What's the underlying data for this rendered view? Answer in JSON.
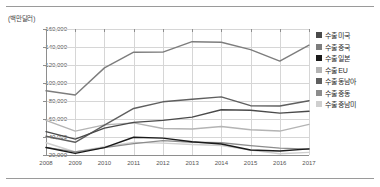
{
  "chart_data": {
    "type": "line",
    "title": "",
    "xlabel": "",
    "ylabel": "(백만달러)",
    "unit_label": "(백만달러)",
    "grid": true,
    "legend_position": "right",
    "x": [
      2008,
      2009,
      2010,
      2011,
      2012,
      2013,
      2014,
      2015,
      2016,
      2017
    ],
    "categories": [
      "2008",
      "2009",
      "2010",
      "2011",
      "2012",
      "2013",
      "2014",
      "2015",
      "2016",
      "2017"
    ],
    "ylim": [
      20000,
      160000
    ],
    "yticks": [
      20000,
      40000,
      60000,
      80000,
      100000,
      120000,
      140000,
      160000
    ],
    "ytick_labels": [
      "20,000",
      "40,000",
      "60,000",
      "80,000",
      "100,000",
      "120,000",
      "140,000",
      "160,000"
    ],
    "series": [
      {
        "name": "수출 미국",
        "color": "#4a4a4a",
        "values": [
          46000,
          37600,
          49800,
          56200,
          58500,
          62100,
          70300,
          69800,
          66500,
          68600
        ]
      },
      {
        "name": "수출 중국",
        "color": "#7d7d7d",
        "values": [
          91400,
          86700,
          116800,
          134200,
          134300,
          145900,
          145300,
          137100,
          124400,
          142100
        ]
      },
      {
        "name": "수출 일본",
        "color": "#1a1a1a",
        "values": [
          28300,
          21800,
          28200,
          39700,
          38800,
          34700,
          32200,
          25600,
          24400,
          26800
        ]
      },
      {
        "name": "수출 EU",
        "color": "#b4b4b4",
        "values": [
          58400,
          46600,
          53500,
          55700,
          49400,
          48900,
          51700,
          48100,
          46600,
          54000
        ]
      },
      {
        "name": "수출 동남아",
        "color": "#5f5f5f",
        "values": [
          40900,
          34100,
          53200,
          71700,
          79100,
          82000,
          84600,
          74800,
          74500,
          80300
        ]
      },
      {
        "name": "수출 중동",
        "color": "#8c8c8c",
        "values": [
          28500,
          23500,
          28200,
          32600,
          36000,
          34200,
          33600,
          30400,
          27600,
          26400
        ]
      },
      {
        "name": "수출 중남미",
        "color": "#cfcfcf",
        "values": [
          33600,
          23300,
          29100,
          34000,
          33200,
          31700,
          30600,
          25400,
          21400,
          22900
        ]
      }
    ]
  },
  "legend": {
    "items": [
      {
        "label": "수출 미국",
        "color": "#4a4a4a"
      },
      {
        "label": "수출 중국",
        "color": "#7d7d7d"
      },
      {
        "label": "수출 일본",
        "color": "#1a1a1a"
      },
      {
        "label": "수출 EU",
        "color": "#b4b4b4"
      },
      {
        "label": "수출 동남아",
        "color": "#5f5f5f"
      },
      {
        "label": "수출 중동",
        "color": "#8c8c8c"
      },
      {
        "label": "수출 중남미",
        "color": "#cfcfcf"
      }
    ]
  }
}
